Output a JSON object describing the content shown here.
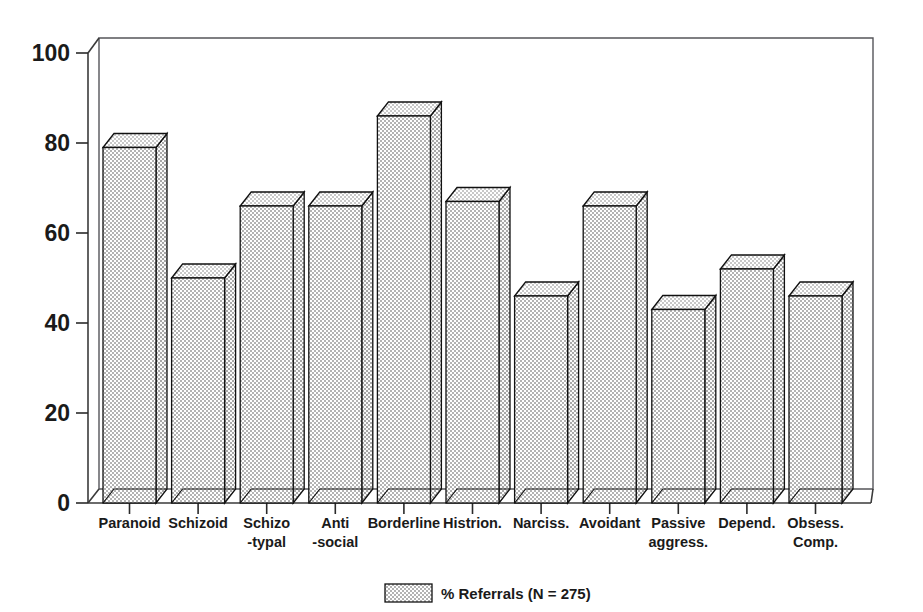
{
  "chart_data": {
    "type": "bar",
    "title": "",
    "subtitle": "",
    "xlabel": "",
    "ylabel": "",
    "ylim": [
      0,
      100
    ],
    "yticks": [
      0,
      20,
      40,
      60,
      80,
      100
    ],
    "ytick_labels": [
      "0",
      "20",
      "40",
      "60",
      "80",
      "100"
    ],
    "grid": false,
    "style": "3d-bar",
    "legend_position": "bottom-center",
    "categories": [
      "Paranoid",
      "Schizoid",
      "Schizo -typal",
      "Anti -social",
      "Borderline",
      "Histrion.",
      "Narciss.",
      "Avoidant",
      "Passive aggress.",
      "Depend.",
      "Obsess. Comp."
    ],
    "category_lines": [
      [
        "Paranoid"
      ],
      [
        "Schizoid"
      ],
      [
        "Schizo",
        "-typal"
      ],
      [
        "Anti",
        "-social"
      ],
      [
        "Borderline"
      ],
      [
        "Histrion."
      ],
      [
        "Narciss."
      ],
      [
        "Avoidant"
      ],
      [
        "Passive",
        "aggress."
      ],
      [
        "Depend."
      ],
      [
        "Obsess.",
        "Comp."
      ]
    ],
    "values": [
      79,
      50,
      66,
      66,
      86,
      67,
      46,
      66,
      43,
      52,
      46
    ],
    "series": [
      {
        "name": "% Referrals (N = 275)",
        "values": [
          79,
          50,
          66,
          66,
          86,
          67,
          46,
          66,
          43,
          52,
          46
        ]
      }
    ],
    "legend": [
      {
        "label": "% Referrals (N = 275)",
        "color": "#d4d4d4"
      }
    ],
    "colors": {
      "bar_fill": "#d4d4d4",
      "bar_top": "#e2e2e2",
      "bar_side": "#c6c6c6",
      "outline": "#111111",
      "axis": "#3a3a3a",
      "text": "#1a1a1a",
      "background": "#ffffff"
    }
  },
  "legend": {
    "label": "% Referrals (N = 275)"
  }
}
